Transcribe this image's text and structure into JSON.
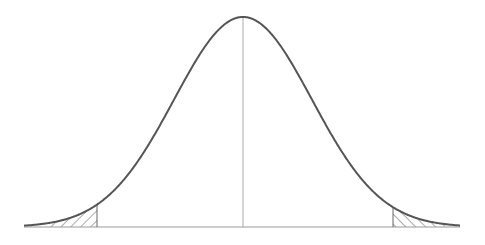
{
  "chart_data": {
    "type": "area",
    "title": "",
    "xlabel": "",
    "ylabel": "",
    "distribution": {
      "name": "normal",
      "mean": 0,
      "sd": 1
    },
    "shaded_regions": [
      {
        "side": "left",
        "from": "-inf",
        "to": -2.1,
        "pattern": "diagonal-hatch"
      },
      {
        "side": "right",
        "from": 2.15,
        "to": "inf",
        "pattern": "diagonal-hatch"
      }
    ],
    "center_line": {
      "x": 0
    },
    "grid": false,
    "legend": null,
    "colors": {
      "curve": "#555555",
      "axis": "#999999",
      "hatch": "#555555",
      "center": "#aaaaaa"
    }
  },
  "layout": {
    "center_px": 243,
    "baseline_px": 227,
    "peak_px": 17,
    "sigma_px": 69,
    "x_start_px": 24,
    "x_end_px": 460,
    "left_cut_px": 97,
    "right_cut_px": 393
  }
}
